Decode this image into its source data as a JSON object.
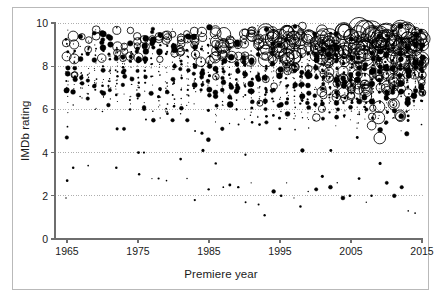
{
  "chart_data": {
    "type": "scatter",
    "title": "",
    "subtitle": "",
    "xlabel": "Premiere year",
    "ylabel": "IMDb rating",
    "xlim": [
      1963.5,
      2016.5
    ],
    "ylim": [
      -0.35,
      10.4
    ],
    "xticks": [
      1965,
      1975,
      1985,
      1995,
      2005,
      2015
    ],
    "xtick_labels": [
      "1965",
      "1975",
      "1985",
      "1995",
      "2005",
      "2015"
    ],
    "yticks": [
      0,
      2,
      4,
      6,
      8,
      10
    ],
    "ytick_labels": [
      "0",
      "2",
      "4",
      "6",
      "8",
      "10"
    ],
    "grid": true,
    "grid_axis": "y",
    "grid_style": "dotted",
    "legend": false,
    "legend_position": "none",
    "marker": "circle",
    "marker_fill": "#000000",
    "marker_stroke": "#000000",
    "size_encoding": "vote count (bubble area)",
    "series": [
      {
        "name": "TV series",
        "color": "#000000",
        "year_range": [
          1965,
          2015
        ],
        "per_year": [
          {
            "year": 1965,
            "n": 26,
            "rating_mean": 7.6,
            "rating_sd": 0.85,
            "max_size": 5.2,
            "outliers": [
              5.2,
              4.7,
              2.7,
              1.9
            ]
          },
          {
            "year": 1966,
            "n": 24,
            "rating_mean": 7.7,
            "rating_sd": 0.8,
            "max_size": 6.0,
            "outliers": [
              6.2,
              3.3
            ]
          },
          {
            "year": 1967,
            "n": 20,
            "rating_mean": 7.7,
            "rating_sd": 0.75,
            "max_size": 4.0,
            "outliers": [
              6.6
            ]
          },
          {
            "year": 1968,
            "n": 22,
            "rating_mean": 7.8,
            "rating_sd": 0.78,
            "max_size": 4.4,
            "outliers": [
              6.5,
              3.4
            ]
          },
          {
            "year": 1969,
            "n": 21,
            "rating_mean": 7.6,
            "rating_sd": 0.82,
            "max_size": 4.2,
            "outliers": [
              6.0
            ]
          },
          {
            "year": 1970,
            "n": 23,
            "rating_mean": 7.7,
            "rating_sd": 0.8,
            "max_size": 4.6,
            "outliers": [
              5.9
            ]
          },
          {
            "year": 1971,
            "n": 22,
            "rating_mean": 7.7,
            "rating_sd": 0.82,
            "max_size": 4.3,
            "outliers": [
              6.2
            ]
          },
          {
            "year": 1972,
            "n": 24,
            "rating_mean": 7.8,
            "rating_sd": 0.8,
            "max_size": 5.4,
            "outliers": [
              5.1,
              3.3
            ]
          },
          {
            "year": 1973,
            "n": 22,
            "rating_mean": 7.6,
            "rating_sd": 0.85,
            "max_size": 4.0,
            "outliers": [
              5.1
            ]
          },
          {
            "year": 1974,
            "n": 23,
            "rating_mean": 7.7,
            "rating_sd": 0.8,
            "max_size": 4.4,
            "outliers": [
              6.0
            ]
          },
          {
            "year": 1975,
            "n": 25,
            "rating_mean": 7.7,
            "rating_sd": 0.85,
            "max_size": 5.0,
            "outliers": [
              4.0,
              3.0
            ]
          },
          {
            "year": 1976,
            "n": 24,
            "rating_mean": 7.6,
            "rating_sd": 0.82,
            "max_size": 4.2,
            "outliers": [
              6.1,
              4.0
            ]
          },
          {
            "year": 1977,
            "n": 26,
            "rating_mean": 7.6,
            "rating_sd": 0.85,
            "max_size": 4.2,
            "outliers": [
              5.5,
              2.8
            ]
          },
          {
            "year": 1978,
            "n": 25,
            "rating_mean": 7.6,
            "rating_sd": 0.85,
            "max_size": 4.1,
            "outliers": [
              5.6,
              2.8
            ]
          },
          {
            "year": 1979,
            "n": 24,
            "rating_mean": 7.5,
            "rating_sd": 0.85,
            "max_size": 4.6,
            "outliers": [
              5.8,
              2.7
            ]
          },
          {
            "year": 1980,
            "n": 22,
            "rating_mean": 7.5,
            "rating_sd": 0.88,
            "max_size": 4.0,
            "outliers": [
              5.5
            ]
          },
          {
            "year": 1981,
            "n": 26,
            "rating_mean": 7.6,
            "rating_sd": 0.85,
            "max_size": 4.4,
            "outliers": [
              5.8,
              3.7
            ]
          },
          {
            "year": 1982,
            "n": 26,
            "rating_mean": 7.6,
            "rating_sd": 0.88,
            "max_size": 4.4,
            "outliers": [
              5.5,
              2.8
            ]
          },
          {
            "year": 1983,
            "n": 27,
            "rating_mean": 7.6,
            "rating_sd": 0.88,
            "max_size": 4.6,
            "outliers": [
              5.0,
              1.8
            ]
          },
          {
            "year": 1984,
            "n": 27,
            "rating_mean": 7.6,
            "rating_sd": 0.9,
            "max_size": 5.0,
            "outliers": [
              4.9,
              4.1
            ]
          },
          {
            "year": 1985,
            "n": 28,
            "rating_mean": 7.6,
            "rating_sd": 0.9,
            "max_size": 4.8,
            "outliers": [
              4.6,
              2.3
            ]
          },
          {
            "year": 1986,
            "n": 30,
            "rating_mean": 7.5,
            "rating_sd": 0.92,
            "max_size": 6.4,
            "outliers": [
              6.6,
              3.5
            ]
          },
          {
            "year": 1987,
            "n": 32,
            "rating_mean": 7.6,
            "rating_sd": 0.92,
            "max_size": 7.2,
            "outliers": [
              5.1,
              2.4
            ]
          },
          {
            "year": 1988,
            "n": 30,
            "rating_mean": 7.5,
            "rating_sd": 0.95,
            "max_size": 6.8,
            "outliers": [
              6.2,
              2.5
            ]
          },
          {
            "year": 1989,
            "n": 32,
            "rating_mean": 7.6,
            "rating_sd": 0.92,
            "max_size": 5.6,
            "outliers": [
              5.3,
              2.4
            ]
          },
          {
            "year": 1990,
            "n": 34,
            "rating_mean": 7.5,
            "rating_sd": 0.95,
            "max_size": 5.4,
            "outliers": [
              3.9,
              1.7
            ]
          },
          {
            "year": 1991,
            "n": 33,
            "rating_mean": 7.5,
            "rating_sd": 0.95,
            "max_size": 5.6,
            "outliers": [
              5.4,
              2.6
            ]
          },
          {
            "year": 1992,
            "n": 34,
            "rating_mean": 7.5,
            "rating_sd": 0.98,
            "max_size": 5.8,
            "outliers": [
              5.3,
              1.6
            ]
          },
          {
            "year": 1993,
            "n": 36,
            "rating_mean": 7.6,
            "rating_sd": 0.95,
            "max_size": 8.0,
            "outliers": [
              5.4,
              1.1
            ]
          },
          {
            "year": 1994,
            "n": 36,
            "rating_mean": 7.6,
            "rating_sd": 0.98,
            "max_size": 9.0,
            "outliers": [
              6.5,
              2.2
            ]
          },
          {
            "year": 1995,
            "n": 38,
            "rating_mean": 7.5,
            "rating_sd": 1.0,
            "max_size": 7.4,
            "outliers": [
              5.1,
              2.0
            ]
          },
          {
            "year": 1996,
            "n": 40,
            "rating_mean": 7.5,
            "rating_sd": 1.0,
            "max_size": 7.8,
            "outliers": [
              6.3,
              2.6
            ]
          },
          {
            "year": 1997,
            "n": 42,
            "rating_mean": 7.6,
            "rating_sd": 1.0,
            "max_size": 8.6,
            "outliers": [
              6.3,
              1.9
            ]
          },
          {
            "year": 1998,
            "n": 42,
            "rating_mean": 7.5,
            "rating_sd": 1.02,
            "max_size": 7.0,
            "outliers": [
              4.1,
              1.5
            ]
          },
          {
            "year": 1999,
            "n": 44,
            "rating_mean": 7.6,
            "rating_sd": 1.02,
            "max_size": 8.4,
            "outliers": [
              6.3,
              2.2
            ]
          },
          {
            "year": 2000,
            "n": 46,
            "rating_mean": 7.5,
            "rating_sd": 1.05,
            "max_size": 7.6,
            "outliers": [
              5.5,
              2.3
            ]
          },
          {
            "year": 2001,
            "n": 46,
            "rating_mean": 7.6,
            "rating_sd": 1.05,
            "max_size": 8.8,
            "outliers": [
              6.4,
              2.9
            ]
          },
          {
            "year": 2002,
            "n": 48,
            "rating_mean": 7.6,
            "rating_sd": 1.05,
            "max_size": 9.2,
            "outliers": [
              4.1,
              2.4
            ]
          },
          {
            "year": 2003,
            "n": 48,
            "rating_mean": 7.5,
            "rating_sd": 1.08,
            "max_size": 8.0,
            "outliers": [
              6.0,
              2.6
            ]
          },
          {
            "year": 2004,
            "n": 50,
            "rating_mean": 7.6,
            "rating_sd": 1.08,
            "max_size": 9.4,
            "outliers": [
              6.3,
              1.9
            ]
          },
          {
            "year": 2005,
            "n": 52,
            "rating_mean": 7.6,
            "rating_sd": 1.08,
            "max_size": 9.0,
            "outliers": [
              6.4,
              2.0
            ]
          },
          {
            "year": 2006,
            "n": 54,
            "rating_mean": 7.6,
            "rating_sd": 1.1,
            "max_size": 10.5,
            "outliers": [
              4.7,
              2.8
            ]
          },
          {
            "year": 2007,
            "n": 54,
            "rating_mean": 7.6,
            "rating_sd": 1.1,
            "max_size": 12.0,
            "outliers": [
              6.1,
              1.7
            ]
          },
          {
            "year": 2008,
            "n": 56,
            "rating_mean": 7.6,
            "rating_sd": 1.1,
            "max_size": 11.0,
            "outliers": [
              5.6,
              2.0
            ]
          },
          {
            "year": 2009,
            "n": 58,
            "rating_mean": 7.6,
            "rating_sd": 1.12,
            "max_size": 11.5,
            "outliers": [
              6.8,
              3.5
            ]
          },
          {
            "year": 2010,
            "n": 58,
            "rating_mean": 7.7,
            "rating_sd": 1.1,
            "max_size": 12.5,
            "outliers": [
              5.4,
              2.6
            ]
          },
          {
            "year": 2011,
            "n": 60,
            "rating_mean": 7.7,
            "rating_sd": 1.1,
            "max_size": 11.0,
            "outliers": [
              6.2,
              2.0
            ]
          },
          {
            "year": 2012,
            "n": 60,
            "rating_mean": 7.7,
            "rating_sd": 1.1,
            "max_size": 10.0,
            "outliers": [
              6.6,
              2.4
            ]
          },
          {
            "year": 2013,
            "n": 62,
            "rating_mean": 7.8,
            "rating_sd": 1.05,
            "max_size": 9.5,
            "outliers": [
              5.9,
              1.3
            ]
          },
          {
            "year": 2014,
            "n": 62,
            "rating_mean": 7.8,
            "rating_sd": 1.02,
            "max_size": 9.0,
            "outliers": [
              6.4,
              1.2
            ]
          },
          {
            "year": 2015,
            "n": 58,
            "rating_mean": 7.9,
            "rating_sd": 0.95,
            "max_size": 8.0,
            "outliers": [
              6.4,
              5.3
            ]
          }
        ]
      }
    ]
  },
  "style": {
    "frame_color": "#b9b9b9",
    "axis_color": "#6e6e6e",
    "grid_color": "#9a9a9a",
    "text_color": "#1a1a1a",
    "marker_color": "#000000",
    "background": "#ffffff"
  }
}
